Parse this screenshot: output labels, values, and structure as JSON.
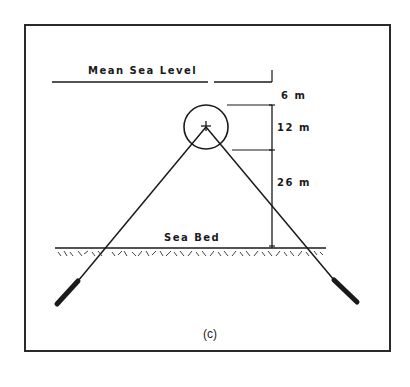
{
  "diagram": {
    "caption": "(c)",
    "labels": {
      "sea_level": "Mean Sea Level",
      "sea_bed": "Sea Bed"
    },
    "dimensions": [
      {
        "id": "top_clearance",
        "label": "6 m"
      },
      {
        "id": "buoy_diameter",
        "label": "12 m"
      },
      {
        "id": "buoy_to_seabed",
        "label": "26 m"
      }
    ],
    "colors": {
      "ink": "#1a1a1a",
      "background": "#ffffff"
    }
  }
}
